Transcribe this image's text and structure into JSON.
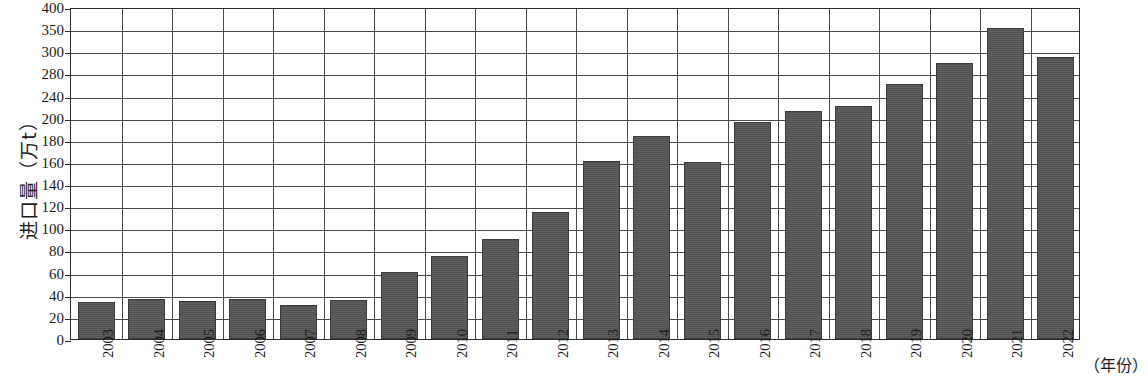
{
  "chart_data": {
    "type": "bar",
    "title": "",
    "xlabel": "（年份）",
    "ylabel": "进口量（万t）",
    "categories": [
      "2003",
      "2004",
      "2005",
      "2006",
      "2007",
      "2008",
      "2009",
      "2010",
      "2011",
      "2012",
      "2013",
      "2014",
      "2015",
      "2016",
      "2017",
      "2018",
      "2019",
      "2020",
      "2021",
      "2022"
    ],
    "values": [
      33,
      36,
      34,
      36,
      31,
      35,
      61,
      75,
      90,
      115,
      161,
      183,
      160,
      196,
      212,
      222,
      261,
      289,
      353,
      295
    ],
    "y_tick_labels": [
      "400",
      "350",
      "300",
      "280",
      "240",
      "200",
      "180",
      "160",
      "140",
      "120",
      "100",
      "80",
      "60",
      "40",
      "20",
      "0"
    ],
    "y_tick_values": [
      400,
      350,
      300,
      280,
      240,
      200,
      180,
      160,
      140,
      120,
      100,
      80,
      60,
      40,
      20,
      0
    ],
    "y_axis_note": "tick labels are spaced evenly in pixels although their numeric intervals are irregular",
    "ylim": [
      0,
      400
    ],
    "grid": "horizontal-and-vertical",
    "legend": "none",
    "bar_color": "#565656",
    "bar_edge_color": "#3a3a3a",
    "axis_color": "#2b2b2b",
    "grid_color": "#4a4a4a"
  }
}
